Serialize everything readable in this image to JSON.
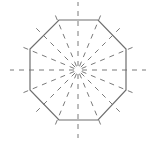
{
  "diagram": {
    "shape": "regular-octagon",
    "center": [
      78,
      70
    ],
    "vertices": [
      [
        59,
        20
      ],
      [
        98,
        20
      ],
      [
        126,
        49
      ],
      [
        126,
        90
      ],
      [
        98,
        120
      ],
      [
        59,
        120
      ],
      [
        30,
        90
      ],
      [
        30,
        49
      ]
    ],
    "symmetry_lines": {
      "count": 16,
      "angle_step_deg": 22.5,
      "inner_radius": 4,
      "outer_radius": 64,
      "axis_extent": 68
    },
    "colors": {
      "background": "#ffffff",
      "outline": "#6e6e6e",
      "dashes": "#7a7a7a"
    }
  }
}
